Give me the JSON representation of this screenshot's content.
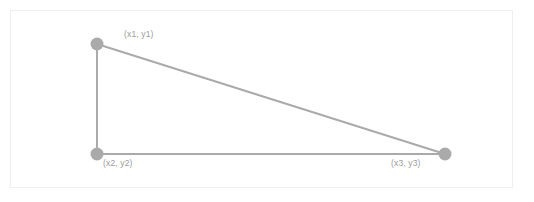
{
  "diagram": {
    "background_color": "#ffffff",
    "frame_border_color": "#efefef",
    "stroke_color": "#aaaaaa",
    "marker_color": "#aaaaaa",
    "label_color": "#9b9b9b",
    "stroke_width": 2,
    "marker_radius": 6.5,
    "vertices": [
      {
        "id": "p1",
        "label": "(x1, y1)",
        "x": 97,
        "y": 44,
        "label_x": 124,
        "label_y": 29
      },
      {
        "id": "p2",
        "label": "(x2, y2)",
        "x": 97,
        "y": 154,
        "label_x": 103,
        "label_y": 158
      },
      {
        "id": "p3",
        "label": "(x3, y3)",
        "x": 445,
        "y": 154,
        "label_x": 391,
        "label_y": 158
      }
    ],
    "edges": [
      {
        "id": "edge-left",
        "from": "p1",
        "to": "p2"
      },
      {
        "id": "edge-bottom",
        "from": "p2",
        "to": "p3"
      },
      {
        "id": "edge-hypotenuse",
        "from": "p1",
        "to": "p3"
      }
    ]
  }
}
